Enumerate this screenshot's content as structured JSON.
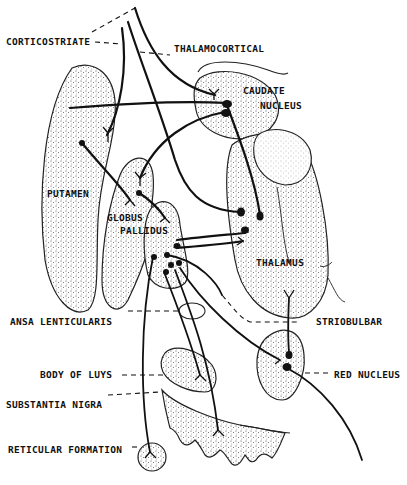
{
  "diagram": {
    "type": "neuroanatomy-schematic",
    "labels": {
      "corticostriate": "CORTICOSTRIATE",
      "thalamocortical": "THALAMOCORTICAL",
      "caudate_1": "CAUDATE",
      "caudate_2": "NUCLEUS",
      "putamen": "PUTAMEN",
      "globus_1": "GLOBUS",
      "globus_2": "PALLIDUS",
      "thalamus": "THALAMUS",
      "ansa": "ANSA LENTICULARIS",
      "striobulbar": "STRIOBULBAR",
      "body_of_luys": "BODY OF LUYS",
      "red_nucleus": "RED NUCLEUS",
      "substantia_nigra": "SUBSTANTIA NIGRA",
      "reticular_formation": "RETICULAR FORMATION"
    },
    "structures": [
      "caudate-nucleus",
      "putamen",
      "globus-pallidus",
      "thalamus",
      "body-of-luys",
      "red-nucleus",
      "substantia-nigra",
      "reticular-formation"
    ],
    "colors": {
      "ink": "#111111",
      "stipple": "#555555",
      "background": "#ffffff"
    }
  }
}
